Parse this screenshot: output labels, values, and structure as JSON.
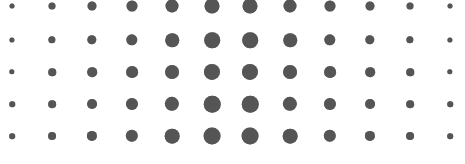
{
  "pattern": {
    "type": "halftone-dot-grid",
    "rows": 5,
    "columns": 12,
    "dot_color": "#555555",
    "background_color": "#ffffff",
    "column_x": [
      12,
      52,
      92,
      132,
      172,
      212,
      250,
      290,
      330,
      370,
      410,
      450
    ],
    "row_y": [
      6,
      40,
      72,
      104,
      136
    ],
    "row_scale": [
      1.0,
      1.04,
      1.07,
      1.1,
      1.13
    ],
    "column_diameters": [
      5,
      7,
      9,
      11,
      13,
      15,
      15,
      13,
      11,
      9,
      7,
      5
    ]
  }
}
